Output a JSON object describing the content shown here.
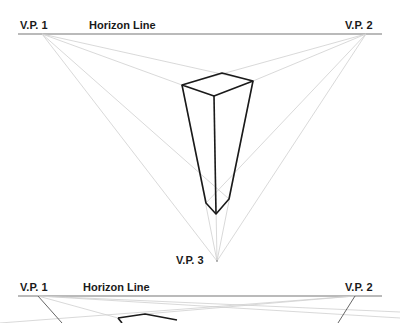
{
  "diagram_top": {
    "vp1_label": "V.P. 1",
    "vp2_label": "V.P. 2",
    "vp3_label": "V.P. 3",
    "horizon_label": "Horizon Line"
  },
  "diagram_bottom": {
    "vp1_label": "V.P. 1",
    "vp2_label": "V.P. 2",
    "horizon_label": "Horizon Line"
  },
  "colors": {
    "horizon": "#777777",
    "guide": "#cfcfcf",
    "edge": "#1a1a1a"
  }
}
